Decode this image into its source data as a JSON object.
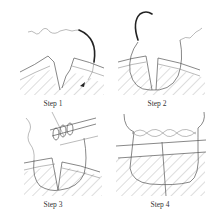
{
  "figure": {
    "panels": [
      {
        "id": "step1",
        "label": "Step 1"
      },
      {
        "id": "step2",
        "label": "Step 2"
      },
      {
        "id": "step3",
        "label": "Step 3"
      },
      {
        "id": "step4",
        "label": "Step 4"
      }
    ]
  },
  "colors": {
    "line": "#555555",
    "needle": "#222222",
    "background": "#ffffff"
  }
}
